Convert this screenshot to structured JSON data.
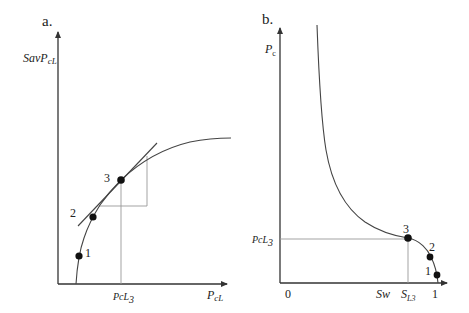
{
  "panel_a": {
    "label": "a.",
    "y_axis_label": "SavP",
    "y_axis_label_sub": "cL",
    "x_axis_label": "P",
    "x_axis_label_sub": "cL",
    "x_marker_label": "PcL",
    "x_marker_label_sub": "3",
    "points": [
      {
        "label": "1"
      },
      {
        "label": "2"
      },
      {
        "label": "3"
      }
    ]
  },
  "panel_b": {
    "label": "b.",
    "y_axis_label": "P",
    "y_axis_label_sub": "c",
    "y_marker_label": "PcL",
    "y_marker_label_sub": "3",
    "x_origin_label": "0",
    "x_axis_label": "Sw",
    "x_marker_label": "S",
    "x_marker_label_sub": "L3",
    "x_end_label": "1",
    "points": [
      {
        "label": "1"
      },
      {
        "label": "2"
      },
      {
        "label": "3"
      }
    ]
  },
  "colors": {
    "axis": "#333333",
    "curve": "#444444",
    "guide": "#999999",
    "point": "#111111"
  }
}
